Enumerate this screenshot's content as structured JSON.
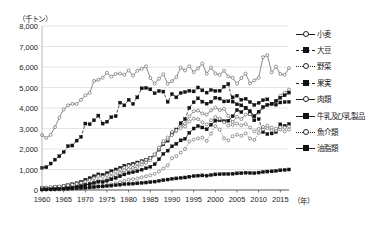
{
  "chart_data": {
    "type": "line",
    "title": "",
    "unit_label": "（千トン）",
    "xlabel": "（年）",
    "ylabel": "",
    "xlim": [
      1960,
      2017
    ],
    "ylim": [
      0,
      8000
    ],
    "ytick_labels": [
      "0",
      "1,000",
      "2,000",
      "3,000",
      "4,000",
      "5,000",
      "6,000",
      "7,000",
      "8,000"
    ],
    "ytick_values": [
      0,
      1000,
      2000,
      3000,
      4000,
      5000,
      6000,
      7000,
      8000
    ],
    "xtick_labels": [
      "1960",
      "1965",
      "1970",
      "1975",
      "1980",
      "1985",
      "1990",
      "1995",
      "2000",
      "2005",
      "2010",
      "2015"
    ],
    "xtick_values": [
      1960,
      1965,
      1970,
      1975,
      1980,
      1985,
      1990,
      1995,
      2000,
      2005,
      2010,
      2015
    ],
    "grid": "horizontal",
    "legend_position": "right",
    "x": [
      1960,
      1961,
      1962,
      1963,
      1964,
      1965,
      1966,
      1967,
      1968,
      1969,
      1970,
      1971,
      1972,
      1973,
      1974,
      1975,
      1976,
      1977,
      1978,
      1979,
      1980,
      1981,
      1982,
      1983,
      1984,
      1985,
      1986,
      1987,
      1988,
      1989,
      1990,
      1991,
      1992,
      1993,
      1994,
      1995,
      1996,
      1997,
      1998,
      1999,
      2000,
      2001,
      2002,
      2003,
      2004,
      2005,
      2006,
      2007,
      2008,
      2009,
      2010,
      2011,
      2012,
      2013,
      2014,
      2015,
      2016,
      2017
    ],
    "series": [
      {
        "name": "小麦",
        "marker": "circle",
        "line": "solid",
        "values": [
          2680,
          2540,
          2690,
          3070,
          3530,
          3930,
          4130,
          4200,
          4200,
          4400,
          4620,
          4740,
          5320,
          5370,
          5480,
          5720,
          5530,
          5660,
          5680,
          5620,
          5830,
          5580,
          5820,
          5910,
          6030,
          5460,
          5190,
          5430,
          5650,
          5180,
          5310,
          5500,
          5970,
          5830,
          6040,
          5750,
          5930,
          6170,
          5670,
          5970,
          5680,
          5620,
          5820,
          5540,
          5480,
          5190,
          5460,
          5680,
          5200,
          5350,
          5470,
          6480,
          6580,
          5740,
          6020,
          5660,
          5620,
          5940
        ],
        "final_value": 5940
      },
      {
        "name": "大豆",
        "marker": "square",
        "line": "dashed",
        "values": [
          1080,
          1110,
          1290,
          1480,
          1650,
          1850,
          2140,
          2170,
          2410,
          2590,
          3240,
          3210,
          3400,
          3630,
          3240,
          3330,
          3550,
          3600,
          4260,
          4130,
          4400,
          4200,
          4520,
          4960,
          4980,
          4910,
          4720,
          4830,
          4800,
          4300,
          4680,
          4520,
          4730,
          4780,
          4840,
          4810,
          5000,
          4860,
          4750,
          4880,
          4830,
          4840,
          5040,
          5170,
          4310,
          4180,
          4130,
          4010,
          3710,
          3400,
          3460,
          2830,
          2730,
          2760,
          2830,
          3200,
          3130,
          3220
        ],
        "final_value": 3220
      },
      {
        "name": "野菜",
        "marker": "circle",
        "line": "dotted",
        "values": [
          10,
          12,
          15,
          18,
          22,
          26,
          32,
          40,
          48,
          60,
          78,
          100,
          130,
          170,
          200,
          240,
          280,
          330,
          380,
          450,
          500,
          530,
          560,
          620,
          670,
          720,
          790,
          900,
          1050,
          1200,
          1550,
          1650,
          1820,
          2000,
          2360,
          2460,
          2520,
          2550,
          2400,
          2750,
          3120,
          2950,
          2520,
          2420,
          2620,
          2700,
          2640,
          2760,
          2510,
          2440,
          2780,
          2950,
          3020,
          2920,
          2900,
          2950,
          2860,
          2950
        ],
        "final_value": 2950
      },
      {
        "name": "果実",
        "marker": "square",
        "line": "dashed",
        "values": [
          80,
          95,
          110,
          130,
          160,
          190,
          230,
          280,
          330,
          400,
          500,
          580,
          670,
          760,
          740,
          830,
          920,
          1000,
          1080,
          1180,
          1230,
          1280,
          1340,
          1410,
          1480,
          1560,
          1720,
          1970,
          2230,
          2410,
          2760,
          2950,
          3260,
          3460,
          4010,
          4280,
          4470,
          4310,
          4210,
          4300,
          4500,
          4460,
          4320,
          4330,
          4520,
          4600,
          4400,
          4450,
          4290,
          4150,
          4250,
          4380,
          4420,
          4200,
          4160,
          4270,
          4290,
          4300
        ],
        "final_value": 4300
      },
      {
        "name": "肉類",
        "marker": "circle",
        "line": "solid",
        "values": [
          15,
          20,
          28,
          38,
          52,
          70,
          92,
          120,
          150,
          190,
          240,
          300,
          390,
          470,
          440,
          530,
          640,
          720,
          830,
          960,
          1010,
          1070,
          1130,
          1230,
          1330,
          1450,
          1700,
          2000,
          2280,
          2480,
          2680,
          2880,
          3100,
          3240,
          3590,
          3840,
          3880,
          3730,
          3680,
          3880,
          4020,
          3900,
          3950,
          3620,
          3320,
          3570,
          3460,
          3680,
          3700,
          3600,
          3770,
          4010,
          4150,
          4180,
          4320,
          4600,
          4750,
          4900
        ],
        "final_value": 4900
      },
      {
        "name": "牛乳及び乳製品",
        "marker": "square",
        "line": "solid",
        "values": [
          40,
          48,
          58,
          70,
          85,
          100,
          120,
          145,
          175,
          210,
          250,
          290,
          340,
          400,
          390,
          450,
          520,
          590,
          670,
          760,
          830,
          870,
          920,
          990,
          1060,
          1130,
          1260,
          1500,
          1760,
          1920,
          2130,
          2250,
          2420,
          2500,
          2790,
          3000,
          3120,
          3050,
          2960,
          3180,
          3380,
          3400,
          3360,
          3380,
          3600,
          3900,
          3800,
          4000,
          3850,
          3600,
          3820,
          4050,
          4150,
          4200,
          4350,
          4500,
          4620,
          4750
        ],
        "final_value": 4750
      },
      {
        "name": "魚介類",
        "marker": "circle",
        "line": "dotted",
        "values": [
          120,
          130,
          145,
          160,
          180,
          200,
          230,
          260,
          300,
          350,
          420,
          490,
          580,
          680,
          650,
          730,
          820,
          900,
          1000,
          1100,
          1180,
          1220,
          1290,
          1380,
          1470,
          1560,
          1750,
          2070,
          2380,
          2560,
          2840,
          2920,
          3020,
          3100,
          3340,
          3480,
          3460,
          3300,
          3200,
          3400,
          3560,
          3480,
          3300,
          3150,
          3180,
          3240,
          3160,
          3220,
          3050,
          2860,
          2980,
          3080,
          3140,
          3050,
          3000,
          3060,
          3050,
          3100
        ],
        "final_value": 3100
      },
      {
        "name": "油脂類",
        "marker": "square",
        "line": "solid",
        "values": [
          30,
          34,
          38,
          44,
          50,
          58,
          66,
          76,
          88,
          100,
          115,
          130,
          150,
          170,
          175,
          195,
          215,
          235,
          260,
          285,
          300,
          310,
          325,
          345,
          365,
          385,
          410,
          445,
          480,
          510,
          545,
          565,
          590,
          610,
          650,
          680,
          700,
          710,
          700,
          730,
          760,
          770,
          780,
          780,
          790,
          810,
          820,
          840,
          830,
          820,
          850,
          880,
          900,
          910,
          930,
          960,
          980,
          1000
        ],
        "final_value": 1000
      }
    ]
  }
}
